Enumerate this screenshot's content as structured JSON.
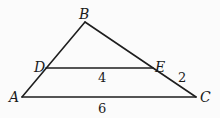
{
  "diagram": {
    "type": "triangle-with-parallel-segment",
    "points": {
      "A": {
        "label": "A",
        "x": 22,
        "y": 97
      },
      "B": {
        "label": "B",
        "x": 85,
        "y": 22
      },
      "C": {
        "label": "C",
        "x": 196,
        "y": 97
      },
      "D": {
        "label": "D",
        "x": 46,
        "y": 68
      },
      "E": {
        "label": "E",
        "x": 153,
        "y": 68
      }
    },
    "segments": [
      {
        "from": "A",
        "to": "B"
      },
      {
        "from": "B",
        "to": "C"
      },
      {
        "from": "A",
        "to": "C"
      },
      {
        "from": "D",
        "to": "E"
      }
    ],
    "measurements": {
      "DE": "4",
      "EC": "2",
      "AC": "6"
    }
  }
}
